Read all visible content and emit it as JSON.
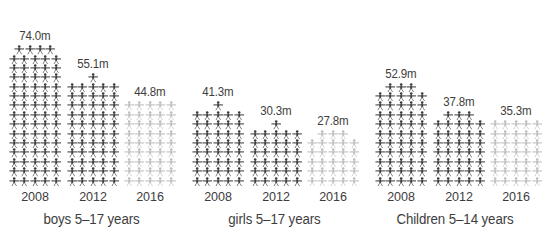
{
  "figure": {
    "background_color": "#ffffff",
    "dark_color": "#3c3c3c",
    "light_color": "#bdbdbd",
    "text_color": "#3d3d3d",
    "icon_name": "person-pictogram-icon",
    "unit_note": "m"
  },
  "chart_data": {
    "type": "bar",
    "title": "",
    "subtitle": "",
    "xlabel": "",
    "ylabel": "",
    "legend": [],
    "grid": false,
    "style": "pictogram / isotype bar chart",
    "categories": [
      "2008",
      "2012",
      "2016"
    ],
    "value_suffix": "m",
    "value_unit": "millions",
    "groups": [
      {
        "name": "boys 5-17 years",
        "caption": "boys 5–17 years",
        "values": [
          74.0,
          55.1,
          44.8
        ],
        "labels": [
          "74.0m",
          "55.1m",
          "44.8m"
        ],
        "bar_colors": [
          "#3c3c3c",
          "#3c3c3c",
          "#bdbdbd"
        ],
        "pictogram_rows": [
          {
            "year": "2008",
            "full_rows": 14,
            "per_row": 5,
            "top_row": 4,
            "color": "dark"
          },
          {
            "year": "2012",
            "full_rows": 11,
            "per_row": 5,
            "top_row": 1,
            "color": "dark"
          },
          {
            "year": "2016",
            "full_rows": 9,
            "per_row": 5,
            "top_row": 0,
            "color": "light"
          }
        ]
      },
      {
        "name": "girls 5-17 years",
        "caption": "girls 5–17 years",
        "values": [
          41.3,
          30.3,
          27.8
        ],
        "labels": [
          "41.3m",
          "30.3m",
          "27.8m"
        ],
        "bar_colors": [
          "#3c3c3c",
          "#3c3c3c",
          "#bdbdbd"
        ],
        "pictogram_rows": [
          {
            "year": "2008",
            "full_rows": 8,
            "per_row": 5,
            "top_row": 1,
            "color": "dark"
          },
          {
            "year": "2012",
            "full_rows": 6,
            "per_row": 5,
            "top_row": 1,
            "color": "dark"
          },
          {
            "year": "2016",
            "full_rows": 5,
            "per_row": 5,
            "top_row": 3,
            "color": "light"
          }
        ]
      },
      {
        "name": "Children 5-14 years",
        "caption": "Children 5–14 years",
        "values": [
          52.9,
          37.8,
          35.3
        ],
        "labels": [
          "52.9m",
          "37.8m",
          "35.3m"
        ],
        "bar_colors": [
          "#3c3c3c",
          "#3c3c3c",
          "#bdbdbd"
        ],
        "pictogram_rows": [
          {
            "year": "2008",
            "full_rows": 10,
            "per_row": 5,
            "top_row": 3,
            "color": "dark"
          },
          {
            "year": "2012",
            "full_rows": 7,
            "per_row": 5,
            "top_row": 3,
            "color": "dark"
          },
          {
            "year": "2016",
            "full_rows": 7,
            "per_row": 5,
            "top_row": 0,
            "color": "light"
          }
        ]
      }
    ]
  }
}
